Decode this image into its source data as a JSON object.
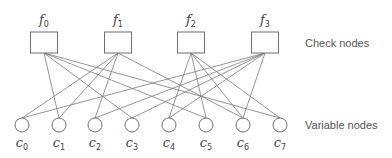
{
  "diagram": {
    "type": "tanner-graph",
    "labels": {
      "check_nodes": "Check nodes",
      "variable_nodes": "Variable nodes"
    },
    "check_nodes": [
      {
        "id": "f0",
        "base": "f",
        "sub": "0",
        "x": 44
      },
      {
        "id": "f1",
        "base": "f",
        "sub": "1",
        "x": 118
      },
      {
        "id": "f2",
        "base": "f",
        "sub": "2",
        "x": 191
      },
      {
        "id": "f3",
        "base": "f",
        "sub": "3",
        "x": 265
      }
    ],
    "variable_nodes": [
      {
        "id": "c0",
        "base": "c",
        "sub": "0",
        "x": 22
      },
      {
        "id": "c1",
        "base": "c",
        "sub": "1",
        "x": 59
      },
      {
        "id": "c2",
        "base": "c",
        "sub": "2",
        "x": 95
      },
      {
        "id": "c3",
        "base": "c",
        "sub": "3",
        "x": 132
      },
      {
        "id": "c4",
        "base": "c",
        "sub": "4",
        "x": 169
      },
      {
        "id": "c5",
        "base": "c",
        "sub": "5",
        "x": 206
      },
      {
        "id": "c6",
        "base": "c",
        "sub": "6",
        "x": 243
      },
      {
        "id": "c7",
        "base": "c",
        "sub": "7",
        "x": 280
      }
    ],
    "edges": [
      [
        "f0",
        "c1"
      ],
      [
        "f0",
        "c3"
      ],
      [
        "f0",
        "c5"
      ],
      [
        "f0",
        "c7"
      ],
      [
        "f1",
        "c0"
      ],
      [
        "f1",
        "c1"
      ],
      [
        "f1",
        "c2"
      ],
      [
        "f1",
        "c6"
      ],
      [
        "f2",
        "c4"
      ],
      [
        "f2",
        "c5"
      ],
      [
        "f2",
        "c7"
      ],
      [
        "f2",
        "c6"
      ],
      [
        "f3",
        "c0"
      ],
      [
        "f3",
        "c2"
      ],
      [
        "f3",
        "c3"
      ],
      [
        "f3",
        "c4"
      ],
      [
        "f3",
        "c6"
      ]
    ]
  }
}
